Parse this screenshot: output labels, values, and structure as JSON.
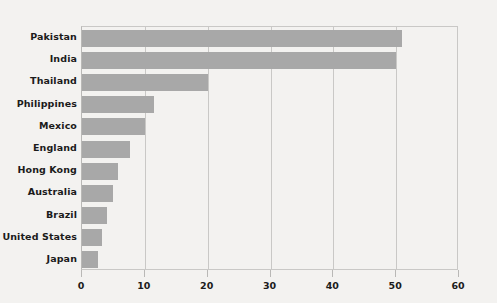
{
  "chart_data": {
    "type": "bar",
    "orientation": "horizontal",
    "title": "",
    "subtitle": "",
    "xlabel": "",
    "ylabel": "",
    "categories": [
      "Pakistan",
      "India",
      "Thailand",
      "Philippines",
      "Mexico",
      "England",
      "Hong Kong",
      "Australia",
      "Brazil",
      "United States",
      "Japan"
    ],
    "values": [
      51,
      50,
      20,
      11.5,
      10,
      7.7,
      5.7,
      5,
      4,
      3.2,
      2.5
    ],
    "xlim": [
      0,
      60
    ],
    "ylim": null,
    "xticks": [
      0,
      10,
      20,
      30,
      40,
      50,
      60
    ],
    "xtick_labels": [
      "0",
      "10",
      "20",
      "30",
      "40",
      "50",
      "60"
    ],
    "grid": "vertical",
    "legend": null,
    "legend_position": "none",
    "annotations": [],
    "colors": {
      "bar": "#a8a8a8",
      "background": "#f3f2f0",
      "gridline": "#c9c8c6",
      "axis": "#b9b8b6",
      "text": "#1b1b1b"
    }
  }
}
